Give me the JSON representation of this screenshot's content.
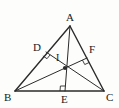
{
  "figure": {
    "background_color": "#fdfdfb",
    "stroke_color": "#2b2b2b",
    "label_color": "#1a1a1a",
    "points": {
      "A": {
        "label": "A",
        "x": 70,
        "y": 26,
        "label_x": 66,
        "label_y": 12
      },
      "B": {
        "label": "B",
        "x": 15,
        "y": 91,
        "label_x": 4,
        "label_y": 92
      },
      "C": {
        "label": "C",
        "x": 104,
        "y": 91,
        "label_x": 106,
        "label_y": 92
      },
      "D": {
        "label": "D",
        "x": 46,
        "y": 52,
        "label_x": 33,
        "label_y": 42
      },
      "E": {
        "label": "E",
        "x": 65,
        "y": 91,
        "label_x": 61,
        "label_y": 94
      },
      "F": {
        "label": "F",
        "x": 87,
        "y": 58,
        "label_x": 89,
        "label_y": 44
      },
      "I": {
        "label": "I",
        "x": 65,
        "y": 68,
        "label_x": 56,
        "label_y": 53
      }
    },
    "segments": [
      {
        "name": "side-AB",
        "from": "A",
        "to": "B",
        "width": 1.4
      },
      {
        "name": "side-AC",
        "from": "A",
        "to": "C",
        "width": 1.4
      },
      {
        "name": "side-BC",
        "from": "B",
        "to": "C",
        "width": 1.4
      },
      {
        "name": "altitude-AE",
        "from": "A",
        "to": "E",
        "width": 1.0
      },
      {
        "name": "altitude-CD",
        "from": "C",
        "to": "D",
        "width": 1.0
      },
      {
        "name": "altitude-BF",
        "from": "B",
        "to": "F",
        "width": 1.0
      }
    ],
    "right_angle_marks": [
      {
        "name": "right-angle-at-D",
        "at": "D"
      },
      {
        "name": "right-angle-at-E",
        "at": "E"
      },
      {
        "name": "right-angle-at-F",
        "at": "F"
      }
    ],
    "marked_points": [
      {
        "name": "orthocenter-dot",
        "at": "I",
        "radius": 2.1
      }
    ]
  }
}
